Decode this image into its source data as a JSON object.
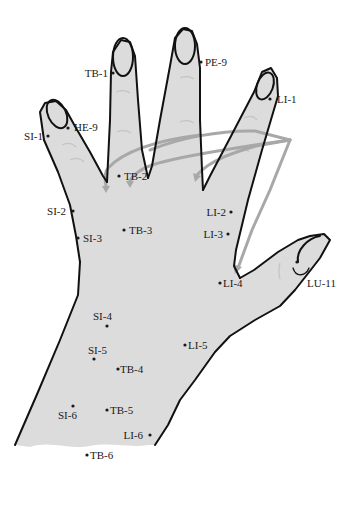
{
  "diagram": {
    "colors": {
      "skin": "#dcdcdc",
      "outline": "#111111",
      "arrow": "#a8a8a8",
      "text": "#1a1a1a",
      "background": "#ffffff"
    },
    "points": [
      {
        "id": "PE-9",
        "label": "PE-9",
        "x": 201,
        "y": 62,
        "lx": 205,
        "ly": 66,
        "anchor": "start"
      },
      {
        "id": "TB-1",
        "label": "TB-1",
        "x": 113,
        "y": 73,
        "lx": 108,
        "ly": 77,
        "anchor": "end"
      },
      {
        "id": "LI-1",
        "label": "LI-1",
        "x": 270,
        "y": 99,
        "lx": 277,
        "ly": 103,
        "anchor": "start"
      },
      {
        "id": "HE-9",
        "label": "HE-9",
        "x": 68,
        "y": 128,
        "lx": 74,
        "ly": 131,
        "anchor": "start"
      },
      {
        "id": "SI-1",
        "label": "SI-1",
        "x": 48,
        "y": 136,
        "lx": 43,
        "ly": 140,
        "anchor": "end"
      },
      {
        "id": "TB-2",
        "label": "TB-2",
        "x": 119,
        "y": 176,
        "lx": 124,
        "ly": 180,
        "anchor": "start"
      },
      {
        "id": "SI-2",
        "label": "SI-2",
        "x": 73,
        "y": 211,
        "lx": 66,
        "ly": 215,
        "anchor": "end"
      },
      {
        "id": "LI-2",
        "label": "LI-2",
        "x": 231,
        "y": 212,
        "lx": 226,
        "ly": 216,
        "anchor": "end"
      },
      {
        "id": "TB-3",
        "label": "TB-3",
        "x": 124,
        "y": 230,
        "lx": 129,
        "ly": 234,
        "anchor": "start"
      },
      {
        "id": "SI-3",
        "label": "SI-3",
        "x": 78,
        "y": 238,
        "lx": 83,
        "ly": 242,
        "anchor": "start"
      },
      {
        "id": "LI-3",
        "label": "LI-3",
        "x": 228,
        "y": 234,
        "lx": 223,
        "ly": 238,
        "anchor": "end"
      },
      {
        "id": "LI-4",
        "label": "LI-4",
        "x": 220,
        "y": 283,
        "lx": 223,
        "ly": 287,
        "anchor": "start"
      },
      {
        "id": "LU-11",
        "label": "LU-11",
        "x": 297,
        "y": 262,
        "lx": 307,
        "ly": 287,
        "anchor": "start"
      },
      {
        "id": "SI-4",
        "label": "SI-4",
        "x": 107,
        "y": 326,
        "lx": 93,
        "ly": 320,
        "anchor": "start"
      },
      {
        "id": "LI-5",
        "label": "LI-5",
        "x": 185,
        "y": 345,
        "lx": 188,
        "ly": 349,
        "anchor": "start"
      },
      {
        "id": "SI-5",
        "label": "SI-5",
        "x": 94,
        "y": 359,
        "lx": 88,
        "ly": 354,
        "anchor": "start"
      },
      {
        "id": "TB-4",
        "label": "TB-4",
        "x": 118,
        "y": 369,
        "lx": 120,
        "ly": 373,
        "anchor": "start"
      },
      {
        "id": "SI-6",
        "label": "SI-6",
        "x": 73,
        "y": 406,
        "lx": 58,
        "ly": 419,
        "anchor": "start"
      },
      {
        "id": "TB-5",
        "label": "TB-5",
        "x": 107,
        "y": 410,
        "lx": 110,
        "ly": 414,
        "anchor": "start"
      },
      {
        "id": "LI-6",
        "label": "LI-6",
        "x": 150,
        "y": 435,
        "lx": 143,
        "ly": 439,
        "anchor": "end"
      },
      {
        "id": "TB-6",
        "label": "TB-6",
        "x": 87,
        "y": 455,
        "lx": 90,
        "ly": 459,
        "anchor": "start"
      }
    ]
  }
}
